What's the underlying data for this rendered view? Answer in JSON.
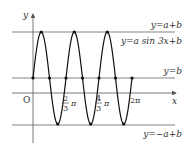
{
  "chart_data": {
    "type": "line",
    "title": "",
    "function": "y = a sin 3x + b",
    "xlabel": "x",
    "ylabel": "y",
    "origin_label": "O",
    "grid": false,
    "x_ticks": [
      {
        "value": 2.0944,
        "label_num": "2",
        "label_den": "3",
        "label_pi": "π"
      },
      {
        "value": 4.1888,
        "label_num": "4",
        "label_den": "3",
        "label_pi": "π"
      },
      {
        "value": 6.2832,
        "label": "2π"
      }
    ],
    "horizontal_lines": [
      {
        "name": "max",
        "label": "y=a+b"
      },
      {
        "name": "mid",
        "label": "y=b"
      },
      {
        "name": "min",
        "label": "y=−a+b"
      }
    ],
    "curve_label": "y=a sin 3x+b",
    "period": "2π/3",
    "x_range": [
      0,
      6.2832
    ],
    "series": [
      {
        "name": "y=a sin 3x+b",
        "x_points_in_pi": [
          0,
          0.1667,
          0.3333,
          0.5,
          0.6667,
          0.8333,
          1.0,
          1.1667,
          1.3333,
          1.5,
          1.6667,
          1.8333,
          2.0
        ],
        "values_relative": [
          "b",
          "a+b",
          "b",
          "-a+b",
          "b",
          "a+b",
          "b",
          "-a+b",
          "b",
          "a+b",
          "b",
          "-a+b",
          "b"
        ]
      }
    ],
    "marked_points": {
      "peaks_x_in_pi": [
        0.1667,
        0.8333,
        1.5
      ],
      "troughs_x_in_pi": [
        0.5,
        1.1667,
        1.8333
      ],
      "midline_crossings_x_in_pi": [
        0,
        0.3333,
        0.6667,
        1.0,
        1.3333,
        1.6667,
        2.0
      ]
    }
  },
  "labels": {
    "y_axis": "y",
    "x_axis": "x",
    "origin": "O",
    "max_line": "y=a+b",
    "curve": "y=a sin 3x+b",
    "mid_line": "y=b",
    "min_line": "y=−a+b",
    "tick1_num": "2",
    "tick1_den": "3",
    "tick1_pi": "π",
    "tick2_num": "4",
    "tick2_den": "3",
    "tick2_pi": "π",
    "tick3": "2π"
  },
  "colors": {
    "axis": "#555555",
    "curve": "#111111",
    "lines": "#666666",
    "text": "#333333"
  }
}
